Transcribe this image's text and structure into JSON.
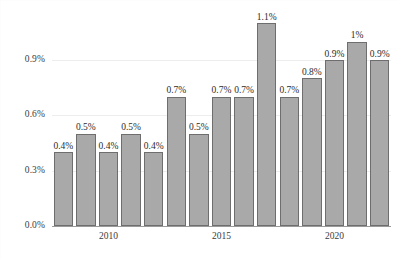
{
  "chart_data": {
    "type": "bar",
    "title": "",
    "subtitle": "",
    "xlabel": "",
    "ylabel": "",
    "categories": [
      "2008",
      "2009",
      "2010",
      "2011",
      "2012",
      "2013",
      "2014",
      "2015",
      "2016",
      "2017",
      "2018",
      "2019",
      "2020",
      "2021",
      "2022"
    ],
    "values": [
      0.4,
      0.5,
      0.4,
      0.5,
      0.4,
      0.7,
      0.5,
      0.7,
      0.7,
      1.1,
      0.7,
      0.8,
      0.9,
      1.0,
      0.9
    ],
    "point_labels": [
      "0.4%",
      "0.5%",
      "0.4%",
      "0.5%",
      "0.4%",
      "0.7%",
      "0.5%",
      "0.7%",
      "0.7%",
      "1.1%",
      "0.7%",
      "0.8%",
      "0.9%",
      "1%",
      "0.9%"
    ],
    "ylim": [
      0.0,
      1.2
    ],
    "yticks": [
      0.0,
      0.3,
      0.6,
      0.9
    ],
    "ytick_labels": [
      "0.0%",
      "0.3%",
      "0.6%",
      "0.9%"
    ],
    "xtick_labels": [
      "2010",
      "2015",
      "2020"
    ],
    "xtick_indices": [
      2,
      7,
      12
    ],
    "grid": true,
    "legend": false,
    "legend_position": "none",
    "series": [
      {
        "name": "",
        "values": [
          0.4,
          0.5,
          0.4,
          0.5,
          0.4,
          0.7,
          0.5,
          0.7,
          0.7,
          1.1,
          0.7,
          0.8,
          0.9,
          1.0,
          0.9
        ]
      }
    ],
    "colors": {
      "bar_fill": "#a9a9a9",
      "bar_border": "#6e6e6e",
      "grid": "#ededed",
      "axis": "#9a9a9a",
      "text": "#2c2c2c",
      "background": "#ffffff"
    }
  }
}
